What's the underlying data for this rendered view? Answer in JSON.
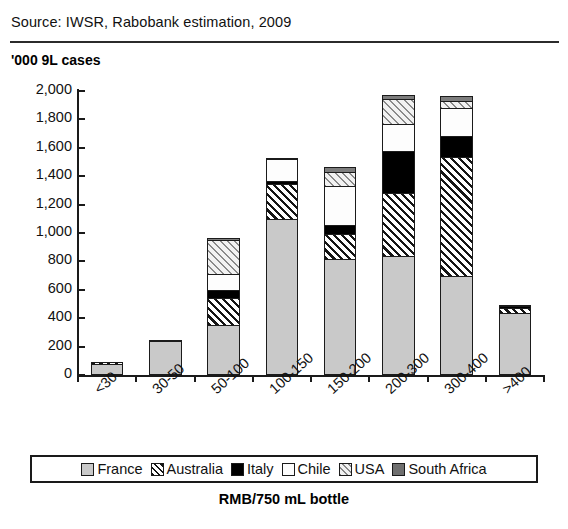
{
  "source_note": "Source: IWSR, Rabobank estimation, 2009",
  "legend": {
    "items": [
      {
        "label": "France",
        "key": "france",
        "color": "#c9c9c9"
      },
      {
        "label": "Australia",
        "key": "australia",
        "color": "#151515"
      },
      {
        "label": "Italy",
        "key": "italy",
        "color": "#000000"
      },
      {
        "label": "Chile",
        "key": "chile",
        "color": "#fdfdfd"
      },
      {
        "label": "USA",
        "key": "usa",
        "color": "#f2f2f2"
      },
      {
        "label": "South Africa",
        "key": "southafrica",
        "color": "#6f6f6f"
      }
    ]
  },
  "chart_data": {
    "type": "bar",
    "title": "",
    "subtitle": "",
    "stacked": true,
    "xlabel": "RMB/750 mL bottle",
    "ylabel": "'000 9L cases",
    "ylim": [
      0,
      2000
    ],
    "yticks": [
      "0",
      "200",
      "400",
      "600",
      "800",
      "1,000",
      "1,200",
      "1,400",
      "1,600",
      "1,800",
      "2,000"
    ],
    "ytick_values": [
      0,
      200,
      400,
      600,
      800,
      1000,
      1200,
      1400,
      1600,
      1800,
      2000
    ],
    "grid": false,
    "legend_position": "bottom",
    "categories": [
      "<30",
      "30-50",
      "50-100",
      "100-150",
      "150-200",
      "200-300",
      "300-400",
      ">400"
    ],
    "series": [
      {
        "name": "France",
        "values": [
          80,
          240,
          350,
          1100,
          820,
          840,
          700,
          440
        ]
      },
      {
        "name": "Australia",
        "values": [
          20,
          15,
          200,
          250,
          180,
          450,
          840,
          40
        ]
      },
      {
        "name": "Italy",
        "values": [
          0,
          0,
          60,
          30,
          70,
          300,
          160,
          20
        ]
      },
      {
        "name": "Chile",
        "values": [
          0,
          0,
          120,
          160,
          280,
          200,
          200,
          0
        ]
      },
      {
        "name": "USA",
        "values": [
          0,
          0,
          250,
          20,
          110,
          180,
          60,
          10
        ]
      },
      {
        "name": "South Africa",
        "values": [
          0,
          0,
          20,
          0,
          40,
          40,
          40,
          0
        ]
      }
    ],
    "totals": [
      100,
      255,
      1000,
      1560,
      1500,
      2010,
      2000,
      510
    ]
  }
}
